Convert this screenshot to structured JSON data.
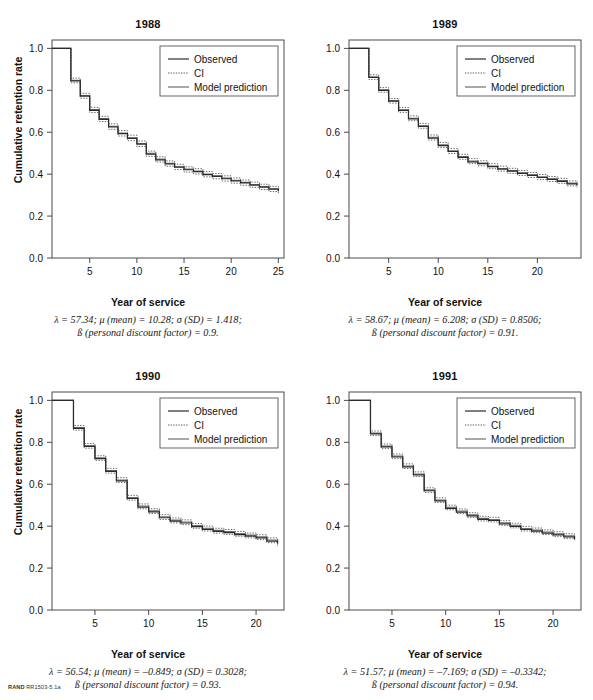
{
  "figure": {
    "footer_bold": "RAND",
    "footer_rest": "RR1503-5.1a",
    "axis": {
      "ylabel": "Cumulative retention rate",
      "xlabel": "Year of service",
      "yticks": [
        "0.0",
        "0.2",
        "0.4",
        "0.6",
        "0.8",
        "1.0"
      ],
      "ylim": [
        0.0,
        1.04
      ]
    },
    "legend": {
      "observed": "Observed",
      "ci": "CI",
      "model": "Model prediction"
    }
  },
  "chart_data": [
    {
      "type": "line",
      "title": "1988",
      "xlabel": "Year of service",
      "ylabel": "Cumulative retention rate",
      "xlim": [
        1,
        25.6
      ],
      "ylim": [
        0.0,
        1.04
      ],
      "xticks": [
        5,
        10,
        15,
        20,
        25
      ],
      "yticks": [
        0.0,
        0.2,
        0.4,
        0.6,
        0.8,
        1.0
      ],
      "grid": false,
      "legend_position": "top-right",
      "legend": [
        "Observed",
        "CI",
        "Model prediction"
      ],
      "x": [
        1,
        2,
        3,
        4,
        5,
        6,
        7,
        8,
        9,
        10,
        11,
        12,
        13,
        14,
        15,
        16,
        17,
        18,
        19,
        20,
        21,
        22,
        23,
        24,
        25
      ],
      "series": [
        {
          "name": "Observed",
          "values": [
            1.0,
            1.0,
            0.845,
            0.772,
            0.704,
            0.661,
            0.625,
            0.593,
            0.571,
            0.543,
            0.495,
            0.468,
            0.449,
            0.433,
            0.421,
            0.412,
            0.398,
            0.389,
            0.378,
            0.368,
            0.358,
            0.348,
            0.338,
            0.328,
            0.318
          ]
        },
        {
          "name": "Model prediction",
          "values": [
            1.0,
            1.0,
            0.848,
            0.775,
            0.708,
            0.665,
            0.628,
            0.596,
            0.574,
            0.546,
            0.499,
            0.472,
            0.452,
            0.436,
            0.424,
            0.415,
            0.401,
            0.392,
            0.381,
            0.371,
            0.361,
            0.351,
            0.341,
            0.331,
            0.321
          ]
        },
        {
          "name": "CI upper",
          "values": [
            1.0,
            1.0,
            0.858,
            0.786,
            0.719,
            0.676,
            0.64,
            0.608,
            0.586,
            0.558,
            0.51,
            0.483,
            0.463,
            0.447,
            0.435,
            0.426,
            0.412,
            0.403,
            0.392,
            0.382,
            0.372,
            0.362,
            0.352,
            0.342,
            0.332
          ]
        },
        {
          "name": "CI lower",
          "values": [
            1.0,
            1.0,
            0.836,
            0.762,
            0.694,
            0.651,
            0.614,
            0.582,
            0.56,
            0.532,
            0.485,
            0.458,
            0.438,
            0.422,
            0.41,
            0.401,
            0.387,
            0.378,
            0.367,
            0.357,
            0.347,
            0.337,
            0.327,
            0.317,
            0.307
          ]
        }
      ],
      "annotation_lines": [
        "λ = 57.34; μ (mean) = 10.28; σ (SD) = 1.418;",
        "ß (personal discount factor) = 0.9."
      ],
      "params": {
        "lambda": 57.34,
        "mu_mean": 10.28,
        "sigma_sd": 1.418,
        "beta_discount": 0.9
      }
    },
    {
      "type": "line",
      "title": "1989",
      "xlabel": "Year of service",
      "ylabel": "Cumulative retention rate",
      "xlim": [
        1,
        24.4
      ],
      "ylim": [
        0.0,
        1.04
      ],
      "xticks": [
        5,
        10,
        15,
        20
      ],
      "yticks": [
        0.0,
        0.2,
        0.4,
        0.6,
        0.8,
        1.0
      ],
      "grid": false,
      "legend_position": "top-right",
      "legend": [
        "Observed",
        "CI",
        "Model prediction"
      ],
      "x": [
        1,
        2,
        3,
        4,
        5,
        6,
        7,
        8,
        9,
        10,
        11,
        12,
        13,
        14,
        15,
        16,
        17,
        18,
        19,
        20,
        21,
        22,
        23,
        24
      ],
      "series": [
        {
          "name": "Observed",
          "values": [
            1.0,
            1.0,
            0.861,
            0.8,
            0.748,
            0.704,
            0.664,
            0.628,
            0.572,
            0.536,
            0.508,
            0.48,
            0.459,
            0.45,
            0.436,
            0.424,
            0.414,
            0.404,
            0.394,
            0.384,
            0.375,
            0.366,
            0.354,
            0.346
          ]
        },
        {
          "name": "Model prediction",
          "values": [
            1.0,
            1.0,
            0.864,
            0.803,
            0.751,
            0.707,
            0.667,
            0.631,
            0.576,
            0.54,
            0.512,
            0.484,
            0.463,
            0.453,
            0.439,
            0.427,
            0.417,
            0.407,
            0.397,
            0.387,
            0.378,
            0.369,
            0.357,
            0.349
          ]
        },
        {
          "name": "CI upper",
          "values": [
            1.0,
            1.0,
            0.874,
            0.813,
            0.761,
            0.718,
            0.678,
            0.642,
            0.587,
            0.551,
            0.523,
            0.495,
            0.474,
            0.464,
            0.45,
            0.438,
            0.428,
            0.418,
            0.408,
            0.398,
            0.389,
            0.38,
            0.368,
            0.36
          ]
        },
        {
          "name": "CI lower",
          "values": [
            1.0,
            1.0,
            0.852,
            0.791,
            0.739,
            0.695,
            0.655,
            0.619,
            0.563,
            0.527,
            0.499,
            0.471,
            0.45,
            0.44,
            0.426,
            0.414,
            0.404,
            0.394,
            0.384,
            0.374,
            0.365,
            0.356,
            0.344,
            0.336
          ]
        }
      ],
      "annotation_lines": [
        "λ = 58.67; μ (mean) = 6.208; σ (SD) = 0.8506;",
        "ß (personal discount factor) = 0.91."
      ],
      "params": {
        "lambda": 58.67,
        "mu_mean": 6.208,
        "sigma_sd": 0.8506,
        "beta_discount": 0.91
      }
    },
    {
      "type": "line",
      "title": "1990",
      "xlabel": "Year of service",
      "ylabel": "Cumulative retention rate",
      "xlim": [
        1,
        22.6
      ],
      "ylim": [
        0.0,
        1.04
      ],
      "xticks": [
        5,
        10,
        15,
        20
      ],
      "yticks": [
        0.0,
        0.2,
        0.4,
        0.6,
        0.8,
        1.0
      ],
      "grid": false,
      "legend_position": "top-right",
      "legend": [
        "Observed",
        "CI",
        "Model prediction"
      ],
      "x": [
        1,
        2,
        3,
        4,
        5,
        6,
        7,
        8,
        9,
        10,
        11,
        12,
        13,
        14,
        15,
        16,
        17,
        18,
        19,
        20,
        21,
        22
      ],
      "series": [
        {
          "name": "Observed",
          "values": [
            1.0,
            1.0,
            0.866,
            0.78,
            0.722,
            0.661,
            0.616,
            0.532,
            0.491,
            0.468,
            0.44,
            0.424,
            0.415,
            0.398,
            0.385,
            0.375,
            0.369,
            0.36,
            0.352,
            0.344,
            0.329,
            0.316
          ]
        },
        {
          "name": "Model prediction",
          "values": [
            1.0,
            1.0,
            0.87,
            0.784,
            0.726,
            0.665,
            0.62,
            0.536,
            0.496,
            0.473,
            0.445,
            0.429,
            0.42,
            0.403,
            0.39,
            0.38,
            0.374,
            0.365,
            0.357,
            0.349,
            0.334,
            0.321
          ]
        },
        {
          "name": "CI upper",
          "values": [
            1.0,
            1.0,
            0.88,
            0.794,
            0.736,
            0.676,
            0.631,
            0.547,
            0.506,
            0.483,
            0.455,
            0.439,
            0.43,
            0.413,
            0.4,
            0.39,
            0.384,
            0.375,
            0.367,
            0.359,
            0.344,
            0.331
          ]
        },
        {
          "name": "CI lower",
          "values": [
            1.0,
            1.0,
            0.858,
            0.772,
            0.714,
            0.653,
            0.608,
            0.524,
            0.483,
            0.46,
            0.432,
            0.416,
            0.407,
            0.39,
            0.377,
            0.367,
            0.361,
            0.352,
            0.344,
            0.336,
            0.321,
            0.308
          ]
        }
      ],
      "annotation_lines": [
        "λ = 56.54; μ (mean) = –0.849; σ (SD) = 0.3028;",
        "ß (personal discount factor) = 0.93."
      ],
      "params": {
        "lambda": 56.54,
        "mu_mean": -0.849,
        "sigma_sd": 0.3028,
        "beta_discount": 0.93
      }
    },
    {
      "type": "line",
      "title": "1991",
      "xlabel": "Year of service",
      "ylabel": "Cumulative retention rate",
      "xlim": [
        1,
        22.6
      ],
      "ylim": [
        0.0,
        1.04
      ],
      "xticks": [
        5,
        10,
        15,
        20
      ],
      "yticks": [
        0.0,
        0.2,
        0.4,
        0.6,
        0.8,
        1.0
      ],
      "grid": false,
      "legend_position": "top-right",
      "legend": [
        "Observed",
        "CI",
        "Model prediction"
      ],
      "x": [
        1,
        2,
        3,
        4,
        5,
        6,
        7,
        8,
        9,
        10,
        11,
        12,
        13,
        14,
        15,
        16,
        17,
        18,
        19,
        20,
        21,
        22
      ],
      "series": [
        {
          "name": "Observed",
          "values": [
            1.0,
            1.0,
            0.84,
            0.778,
            0.73,
            0.683,
            0.645,
            0.569,
            0.521,
            0.485,
            0.467,
            0.449,
            0.432,
            0.427,
            0.411,
            0.399,
            0.384,
            0.376,
            0.367,
            0.358,
            0.349,
            0.339
          ]
        },
        {
          "name": "Model prediction",
          "values": [
            1.0,
            1.0,
            0.844,
            0.782,
            0.734,
            0.687,
            0.649,
            0.573,
            0.525,
            0.49,
            0.472,
            0.454,
            0.437,
            0.432,
            0.416,
            0.404,
            0.389,
            0.381,
            0.372,
            0.363,
            0.354,
            0.344
          ]
        },
        {
          "name": "CI upper",
          "values": [
            1.0,
            1.0,
            0.854,
            0.792,
            0.744,
            0.697,
            0.659,
            0.583,
            0.535,
            0.5,
            0.482,
            0.464,
            0.447,
            0.442,
            0.426,
            0.414,
            0.399,
            0.391,
            0.382,
            0.373,
            0.364,
            0.354
          ]
        },
        {
          "name": "CI lower",
          "values": [
            1.0,
            1.0,
            0.832,
            0.77,
            0.722,
            0.675,
            0.637,
            0.561,
            0.513,
            0.478,
            0.46,
            0.442,
            0.425,
            0.42,
            0.404,
            0.392,
            0.377,
            0.369,
            0.36,
            0.351,
            0.342,
            0.332
          ]
        }
      ],
      "annotation_lines": [
        "λ = 51.57; μ (mean) = –7.169; σ (SD) = –0.3342;",
        "ß (personal discount factor) = 0.94."
      ],
      "params": {
        "lambda": 51.57,
        "mu_mean": -7.169,
        "sigma_sd": -0.3342,
        "beta_discount": 0.94
      }
    }
  ]
}
